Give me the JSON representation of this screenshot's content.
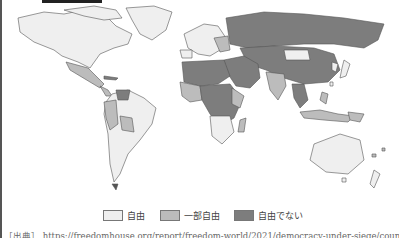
{
  "map": {
    "type": "choropleth",
    "subject": "world freedom status",
    "colors": {
      "free": "#efefef",
      "partly_free": "#bcbcbc",
      "not_free": "#7d7d7d",
      "border": "#555555"
    }
  },
  "legend": {
    "items": [
      {
        "label": "自由",
        "color": "#efefef"
      },
      {
        "label": "一部自由",
        "color": "#bcbcbc"
      },
      {
        "label": "自由でない",
        "color": "#7d7d7d"
      }
    ]
  },
  "source": {
    "text": "［出典］ https://freedomhouse.org/report/freedom-world/2021/democracy-under-siege/coun"
  }
}
